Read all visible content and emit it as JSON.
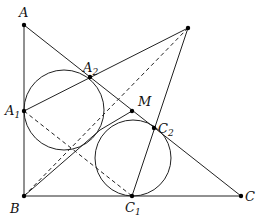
{
  "figure": {
    "type": "geometry-diagram",
    "points": {
      "A": {
        "label": "A",
        "sub": "",
        "x": 24,
        "y": 25
      },
      "B": {
        "label": "B",
        "sub": "",
        "x": 24,
        "y": 196
      },
      "C": {
        "label": "C",
        "sub": "",
        "x": 241,
        "y": 196
      },
      "P": {
        "label": "",
        "sub": "",
        "x": 188,
        "y": 28
      },
      "A1": {
        "label": "A",
        "sub": "1",
        "x": 24,
        "y": 111
      },
      "A2": {
        "label": "A",
        "sub": "2",
        "x": 90,
        "y": 77
      },
      "M": {
        "label": "M",
        "sub": "",
        "x": 132,
        "y": 111
      },
      "C1": {
        "label": "C",
        "sub": "1",
        "x": 132,
        "y": 196
      },
      "C2": {
        "label": "C",
        "sub": "2",
        "x": 154,
        "y": 128
      }
    },
    "circles": [
      {
        "name": "circle-a",
        "cx": 64,
        "cy": 110,
        "r": 40
      },
      {
        "name": "circle-c",
        "cx": 133,
        "cy": 158,
        "r": 38
      }
    ],
    "colors": {
      "stroke": "#222222",
      "point": "#000000"
    }
  }
}
